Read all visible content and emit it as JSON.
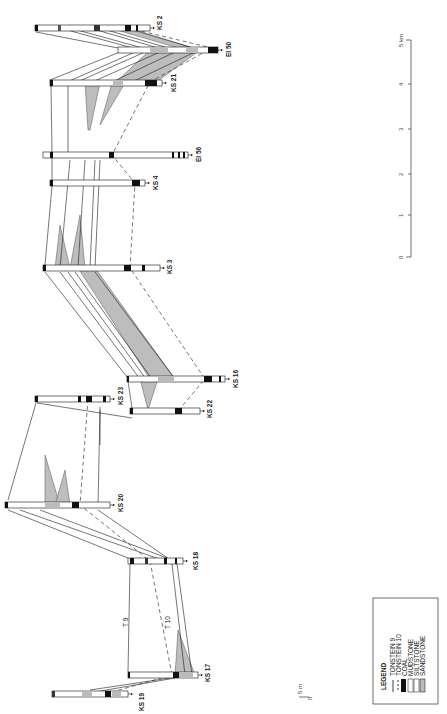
{
  "diagram": {
    "type": "borehole-correlation-section",
    "orientation": "rotated-90",
    "boreholes": [
      {
        "id": "ks2",
        "label": "KS 2"
      },
      {
        "id": "ei50",
        "label": "EI 50"
      },
      {
        "id": "ks21",
        "label": "KS 21"
      },
      {
        "id": "ei56",
        "label": "EI 56"
      },
      {
        "id": "ks4",
        "label": "KS 4"
      },
      {
        "id": "ks3",
        "label": "KS 3"
      },
      {
        "id": "ks16",
        "label": "KS 16"
      },
      {
        "id": "ks23",
        "label": "KS 23"
      },
      {
        "id": "ks22",
        "label": "KS 22"
      },
      {
        "id": "ks20",
        "label": "KS 20"
      },
      {
        "id": "ks18",
        "label": "KS 18"
      },
      {
        "id": "ks17",
        "label": "KS 17"
      },
      {
        "id": "ks19",
        "label": "KS 19"
      }
    ],
    "marker_labels": {
      "t9": "T 9",
      "t10": "T 10"
    },
    "horizontal_scale": {
      "unit_label": "5 km",
      "ticks": [
        "0",
        "1",
        "2",
        "3",
        "4"
      ]
    },
    "vertical_scale": {
      "top": "5 m",
      "bottom": "0"
    },
    "legend": {
      "title": "LEGEND",
      "items": [
        {
          "label": "TONSTEIN 9",
          "symbol": "solid-line"
        },
        {
          "label": "TONSTEIN 10",
          "symbol": "dashed-line"
        },
        {
          "label": "COAL",
          "symbol": "black-box"
        },
        {
          "label": "MUDSTONE",
          "symbol": "white-box"
        },
        {
          "label": "SILTSTONE",
          "symbol": "white-box"
        },
        {
          "label": "SANDSTONE",
          "symbol": "grey-box"
        }
      ]
    },
    "colors": {
      "coal": "#111111",
      "sandstone": "#b8b8b8",
      "line": "#1a1a1a",
      "background": "#ffffff"
    }
  }
}
